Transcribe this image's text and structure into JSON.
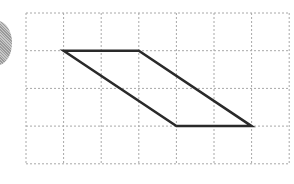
{
  "diagram": {
    "type": "grid-figure",
    "grid": {
      "columns": 7,
      "rows": 4,
      "origin_x": 26,
      "origin_y": 13,
      "cell_w": 37.6,
      "cell_h": 37.7,
      "line_color": "#a8a8a8",
      "line_style": "dotted"
    },
    "shape": {
      "name": "parallelogram",
      "stroke": "#2a2a2a",
      "stroke_width": 2.5,
      "vertices_grid": [
        [
          1,
          1
        ],
        [
          3,
          1
        ],
        [
          6,
          3
        ],
        [
          4,
          3
        ]
      ]
    },
    "decoration": {
      "name": "partial-circle",
      "color": "#b0b0b0"
    }
  }
}
